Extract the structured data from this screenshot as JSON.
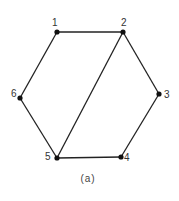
{
  "diagram": {
    "type": "graph",
    "caption": "(a)",
    "nodes": [
      {
        "id": "1",
        "label": "1",
        "x": 57,
        "y": 32,
        "lx": 52,
        "ly": 26
      },
      {
        "id": "2",
        "label": "2",
        "x": 123,
        "y": 32,
        "lx": 121,
        "ly": 26
      },
      {
        "id": "3",
        "label": "3",
        "x": 159,
        "y": 94,
        "lx": 164,
        "ly": 98
      },
      {
        "id": "4",
        "label": "4",
        "x": 121,
        "y": 157,
        "lx": 124,
        "ly": 161
      },
      {
        "id": "5",
        "label": "5",
        "x": 57,
        "y": 158,
        "lx": 45,
        "ly": 160
      },
      {
        "id": "6",
        "label": "6",
        "x": 20,
        "y": 98,
        "lx": 11,
        "ly": 97
      }
    ],
    "edges": [
      {
        "from": "1",
        "to": "2"
      },
      {
        "from": "2",
        "to": "3"
      },
      {
        "from": "3",
        "to": "4"
      },
      {
        "from": "4",
        "to": "5"
      },
      {
        "from": "5",
        "to": "6"
      },
      {
        "from": "6",
        "to": "1"
      },
      {
        "from": "2",
        "to": "5"
      }
    ]
  }
}
